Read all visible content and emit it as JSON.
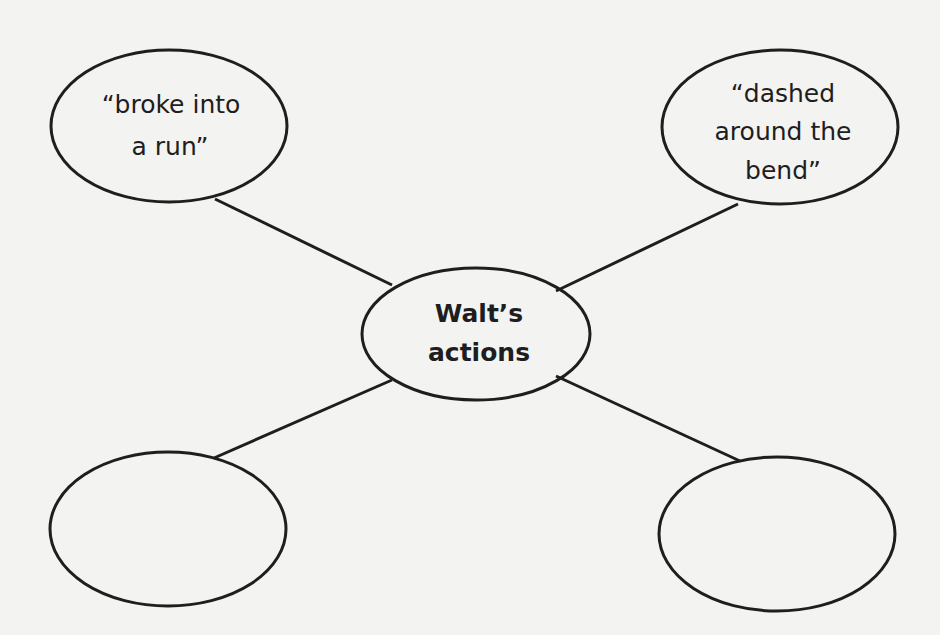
{
  "diagram": {
    "type": "web-organizer",
    "colors": {
      "background": "#f3f3f1",
      "stroke": "#1e1e1e",
      "text": "#1e1e1e"
    },
    "center": {
      "lines": [
        "Walt’s",
        "actions"
      ]
    },
    "nodes": [
      {
        "position": "top-left",
        "lines": [
          "“broke into",
          "a run”"
        ]
      },
      {
        "position": "top-right",
        "lines": [
          "“dashed",
          "around the",
          "bend”"
        ]
      },
      {
        "position": "bottom-left",
        "lines": []
      },
      {
        "position": "bottom-right",
        "lines": []
      }
    ]
  }
}
